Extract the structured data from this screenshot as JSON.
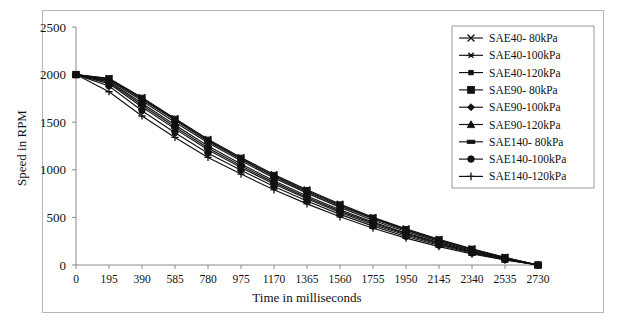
{
  "figure": {
    "background_color": "#ffffff",
    "frame_color": "#b8b8b8",
    "axis_color": "#8a8a8a",
    "ink_color": "#111111"
  },
  "chart_data": {
    "type": "line",
    "title": "",
    "xlabel": "Time in milliseconds",
    "ylabel": "Speed in RPM",
    "xlim": [
      0,
      2730
    ],
    "ylim": [
      0,
      2500
    ],
    "xticks": [
      0,
      195,
      390,
      585,
      780,
      975,
      1170,
      1365,
      1560,
      1755,
      1950,
      2145,
      2340,
      2535,
      2730
    ],
    "yticks": [
      0,
      500,
      1000,
      1500,
      2000,
      2500
    ],
    "xtick_labels": [
      "0",
      "195",
      "390",
      "585",
      "780",
      "975",
      "1170",
      "1365",
      "1560",
      "1755",
      "1950",
      "2145",
      "2340",
      "2535",
      "2730"
    ],
    "ytick_labels": [
      "0",
      "500",
      "1000",
      "1500",
      "2000",
      "2500"
    ],
    "grid": false,
    "legend_position": "upper right",
    "x": [
      0,
      195,
      390,
      585,
      780,
      975,
      1170,
      1365,
      1560,
      1755,
      1950,
      2145,
      2340,
      2535,
      2730
    ],
    "series": [
      {
        "name": "SAE40- 80kPa",
        "marker": "x-cross",
        "values": [
          2000,
          1960,
          1760,
          1540,
          1320,
          1130,
          950,
          790,
          640,
          500,
          380,
          270,
          170,
          80,
          0
        ]
      },
      {
        "name": "SAE40-100kPa",
        "marker": "asterisk",
        "values": [
          2000,
          1950,
          1740,
          1520,
          1300,
          1110,
          930,
          770,
          620,
          485,
          365,
          258,
          160,
          75,
          0
        ]
      },
      {
        "name": "SAE40-120kPa",
        "marker": "small-square",
        "values": [
          2000,
          1940,
          1725,
          1500,
          1285,
          1095,
          915,
          755,
          605,
          470,
          352,
          248,
          152,
          70,
          0
        ]
      },
      {
        "name": "SAE90- 80kPa",
        "marker": "large-square",
        "values": [
          2000,
          1955,
          1750,
          1530,
          1310,
          1120,
          940,
          780,
          630,
          492,
          372,
          263,
          165,
          78,
          0
        ]
      },
      {
        "name": "SAE90-100kPa",
        "marker": "diamond",
        "values": [
          2000,
          1930,
          1700,
          1470,
          1250,
          1060,
          885,
          725,
          580,
          450,
          335,
          235,
          143,
          66,
          0
        ]
      },
      {
        "name": "SAE90-120kPa",
        "marker": "triangle",
        "values": [
          2000,
          1905,
          1660,
          1430,
          1210,
          1025,
          850,
          695,
          552,
          425,
          315,
          218,
          132,
          60,
          0
        ]
      },
      {
        "name": "SAE140- 80kPa",
        "marker": "dash",
        "values": [
          2000,
          1920,
          1680,
          1450,
          1230,
          1042,
          868,
          710,
          566,
          438,
          325,
          226,
          137,
          63,
          0
        ]
      },
      {
        "name": "SAE140-100kPa",
        "marker": "circle",
        "values": [
          2000,
          1880,
          1620,
          1390,
          1175,
          995,
          825,
          672,
          532,
          408,
          300,
          207,
          124,
          56,
          0
        ]
      },
      {
        "name": "SAE140-120kPa",
        "marker": "plus",
        "values": [
          2000,
          1820,
          1565,
          1340,
          1130,
          955,
          790,
          642,
          506,
          386,
          282,
          193,
          115,
          52,
          0
        ]
      }
    ]
  }
}
